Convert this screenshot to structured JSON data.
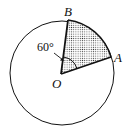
{
  "diagram": {
    "type": "circle-sector",
    "labels": {
      "center": "O",
      "point_a": "A",
      "point_b": "B",
      "angle": "60°"
    },
    "sector_angle_degrees": 60,
    "shaded_region": "sector AOB",
    "colors": {
      "stroke": "#111111",
      "fill_dots": "#333333",
      "background": "#ffffff"
    }
  }
}
